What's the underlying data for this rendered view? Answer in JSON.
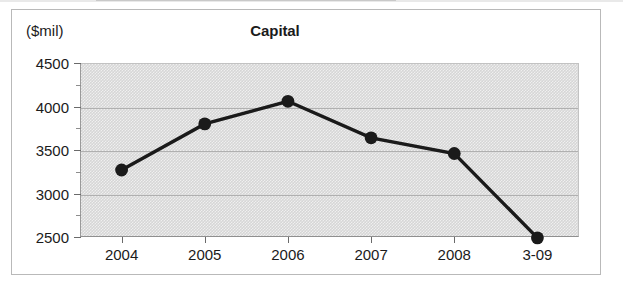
{
  "figure": {
    "title": "Capital",
    "y_unit_label": "($mil)"
  },
  "chart_data": {
    "type": "line",
    "title": "Capital",
    "xlabel": "",
    "ylabel": "($mil)",
    "categories": [
      "2004",
      "2005",
      "2006",
      "2007",
      "2008",
      "3-09"
    ],
    "values": [
      3270,
      3800,
      4060,
      3640,
      3460,
      2490
    ],
    "ylim": [
      2500,
      4500
    ],
    "ytick_labels": [
      "4500",
      "4000",
      "3500",
      "3000",
      "2500"
    ],
    "ytick_values": [
      4500,
      4000,
      3500,
      3000,
      2500
    ],
    "y_minor_tick_values": [
      4250,
      3750,
      3250,
      2750
    ],
    "grid": true,
    "legend": "none",
    "series_color": "#1a1a1a",
    "marker": "circle",
    "plot_background_color": "#d6d6d6"
  }
}
